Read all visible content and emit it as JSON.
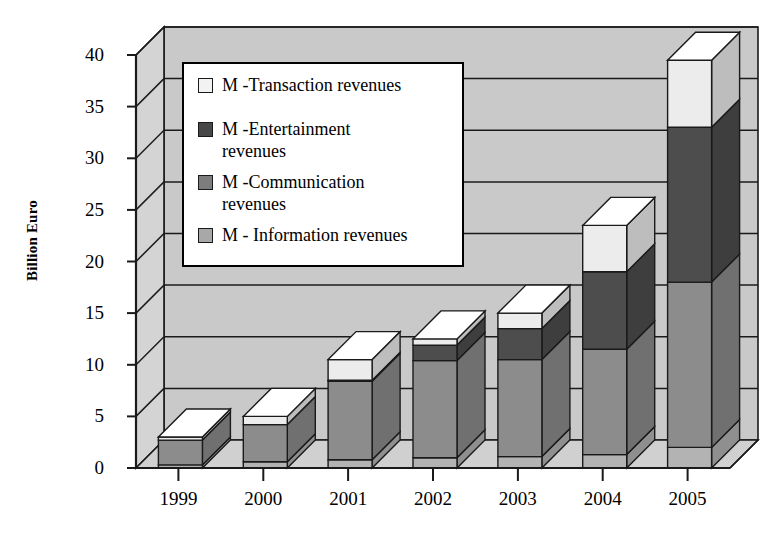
{
  "chart_data": {
    "type": "bar",
    "subtype": "stacked-3d-column",
    "title": "",
    "xlabel": "",
    "ylabel": "Billion Euro",
    "ylim": [
      0,
      40
    ],
    "yticks": [
      0,
      5,
      10,
      15,
      20,
      25,
      30,
      35,
      40
    ],
    "grid": true,
    "legend_position": "upper-left-inside",
    "categories": [
      "1999",
      "2000",
      "2001",
      "2002",
      "2003",
      "2004",
      "2005"
    ],
    "series": [
      {
        "name": "M - Information revenues",
        "color": "#b3b3b3",
        "values": [
          0.3,
          0.6,
          0.8,
          1.0,
          1.1,
          1.3,
          2.0
        ]
      },
      {
        "name": "M -Communication revenues",
        "color": "#8c8c8c",
        "values": [
          2.4,
          3.6,
          7.6,
          9.4,
          9.4,
          10.2,
          16.0
        ]
      },
      {
        "name": "M -Entertainment revenues",
        "color": "#4d4d4d",
        "values": [
          0.0,
          0.0,
          0.1,
          1.5,
          3.0,
          7.5,
          15.0
        ]
      },
      {
        "name": "M -Transaction revenues",
        "color": "#ececec",
        "values": [
          0.3,
          0.8,
          2.0,
          0.6,
          1.5,
          4.5,
          6.5
        ]
      }
    ],
    "totals": [
      3.0,
      5.0,
      10.5,
      12.5,
      15.0,
      23.5,
      39.5
    ]
  },
  "legend": {
    "items": [
      {
        "label": "M -Transaction revenues",
        "swatch": "#f2f2f2"
      },
      {
        "label": "M -Entertainment\nrevenues",
        "swatch": "#474747"
      },
      {
        "label": "M -Communication\nrevenues",
        "swatch": "#7d7d7d"
      },
      {
        "label": "M - Information revenues",
        "swatch": "#a8a8a8"
      }
    ]
  },
  "axis": {
    "y_title": "Billion Euro",
    "y_tick_labels": [
      "40",
      "35",
      "30",
      "25",
      "20",
      "15",
      "10",
      "5",
      "0"
    ],
    "x_tick_labels": [
      "1999",
      "2000",
      "2001",
      "2002",
      "2003",
      "2004",
      "2005"
    ]
  },
  "colors": {
    "wall_back": "#c9c9c9",
    "wall_side": "#d4d4d4",
    "floor": "#d0d0d0",
    "outline": "#1a1a1a"
  }
}
